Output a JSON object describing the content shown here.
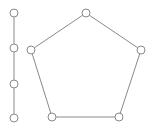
{
  "figure": {
    "width": 154,
    "height": 129,
    "background_color": "#ffffff",
    "stroke_color": "#8a8a8a",
    "node_fill_color": "#ffffff",
    "node_radius": 4,
    "edge_width": 1
  },
  "chart_data": {
    "type": "diagram",
    "subtype": "node-link-graph",
    "title": "",
    "xlabel": "",
    "ylabel": "",
    "grid": false,
    "legend": null,
    "axis_ranges": {
      "x": [
        0,
        154
      ],
      "y": [
        0,
        129
      ]
    },
    "components": [
      {
        "name": "left-path",
        "shape": "path",
        "node_count": 4,
        "edge_count": 3,
        "node_ids": [
          "p1",
          "p2",
          "p3",
          "p4"
        ]
      },
      {
        "name": "pentagon-cycle",
        "shape": "cycle",
        "node_count": 5,
        "edge_count": 5,
        "node_ids": [
          "c1",
          "c2",
          "c3",
          "c4",
          "c5"
        ]
      }
    ],
    "nodes": [
      {
        "id": "p1",
        "label": "",
        "x": 14,
        "y": 13,
        "component": "left-path"
      },
      {
        "id": "p2",
        "label": "",
        "x": 14,
        "y": 48,
        "component": "left-path"
      },
      {
        "id": "p3",
        "label": "",
        "x": 14,
        "y": 84,
        "component": "left-path"
      },
      {
        "id": "p4",
        "label": "",
        "x": 14,
        "y": 118,
        "component": "left-path"
      },
      {
        "id": "c1",
        "label": "",
        "x": 86,
        "y": 13,
        "component": "pentagon-cycle"
      },
      {
        "id": "c2",
        "label": "",
        "x": 141,
        "y": 50,
        "component": "pentagon-cycle"
      },
      {
        "id": "c3",
        "label": "",
        "x": 119,
        "y": 117,
        "component": "pentagon-cycle"
      },
      {
        "id": "c4",
        "label": "",
        "x": 52,
        "y": 117,
        "component": "pentagon-cycle"
      },
      {
        "id": "c5",
        "label": "",
        "x": 31,
        "y": 50,
        "component": "pentagon-cycle"
      }
    ],
    "edges": [
      {
        "id": "e1",
        "source": "p1",
        "target": "p2"
      },
      {
        "id": "e2",
        "source": "p2",
        "target": "p3"
      },
      {
        "id": "e3",
        "source": "p3",
        "target": "p4"
      },
      {
        "id": "e4",
        "source": "c1",
        "target": "c2"
      },
      {
        "id": "e5",
        "source": "c2",
        "target": "c3"
      },
      {
        "id": "e6",
        "source": "c3",
        "target": "c4"
      },
      {
        "id": "e7",
        "source": "c4",
        "target": "c5"
      },
      {
        "id": "e8",
        "source": "c5",
        "target": "c1"
      }
    ],
    "total_nodes": 9,
    "total_edges": 8
  }
}
